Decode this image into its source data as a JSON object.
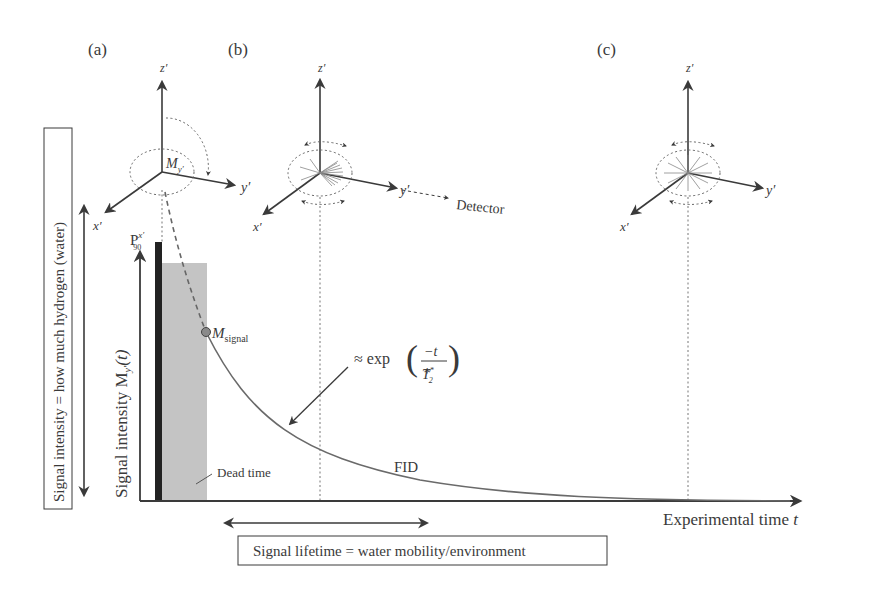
{
  "panels": {
    "a": {
      "label": "(a)",
      "x_axis": "x′",
      "y_axis": "y′",
      "z_axis": "z′",
      "vector_label": "M",
      "vector_sub": "y′"
    },
    "b": {
      "label": "(b)",
      "x_axis": "x′",
      "y_axis": "y′",
      "z_axis": "z′",
      "detector_label": "Detector"
    },
    "c": {
      "label": "(c)",
      "x_axis": "x′",
      "y_axis": "y′",
      "z_axis": "z′"
    }
  },
  "graph": {
    "y_axis_label": "Signal intensity M",
    "y_axis_sub": "y′",
    "y_axis_suffix": "(t)",
    "x_axis_label": "Experimental time ",
    "x_axis_var": "t",
    "pulse_label": "P",
    "pulse_sup": "x′",
    "pulse_sub": "90",
    "signal_point_label": "M",
    "signal_point_sub": "signal",
    "dead_time_label": "Dead time",
    "fid_label": "FID",
    "formula_prefix": "≈ exp",
    "formula_numerator": "−t",
    "formula_denominator": "T",
    "formula_den_sub": "2",
    "formula_den_sup": "*"
  },
  "annotations": {
    "left_box": "Signal intensity = how much hydrogen (water)",
    "bottom_box": "Signal lifetime = water mobility/environment"
  },
  "colors": {
    "ink": "#3a3a3a",
    "pulse": "#222222",
    "dead_time": "#c4c4c4",
    "signal_point": "#8a8a8a"
  }
}
